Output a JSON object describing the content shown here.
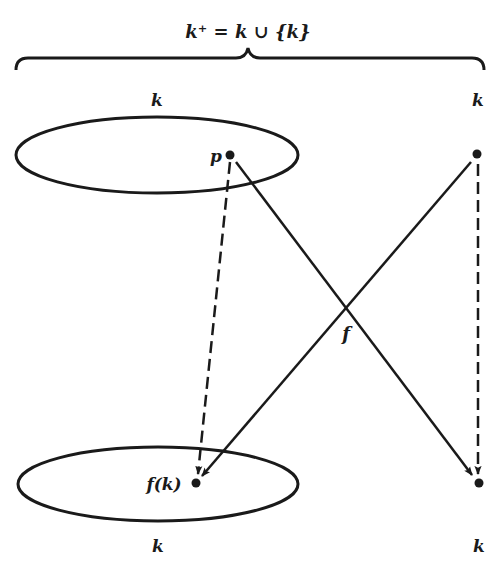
{
  "diagram": {
    "title": "k⁺ = k ∪ {k}",
    "brace_label": "k⁺ = k ∪ {k}",
    "top_left_set_label": "k",
    "top_right_label": "k",
    "bottom_left_set_label": "k",
    "bottom_right_label": "k",
    "point_p_label": "p",
    "point_fk_label": "f(k)",
    "function_label": "f",
    "colors": {
      "ink": "#1a1a1a",
      "background": "#ffffff"
    },
    "nodes": [
      {
        "id": "p",
        "label": "p",
        "x": 230,
        "y": 155
      },
      {
        "id": "k_top",
        "label": "",
        "x": 477,
        "y": 154
      },
      {
        "id": "fk",
        "label": "f(k)",
        "x": 196,
        "y": 483
      },
      {
        "id": "k_bottom",
        "label": "",
        "x": 479,
        "y": 483
      }
    ],
    "edges": [
      {
        "from": "p",
        "to": "fk",
        "style": "dashed"
      },
      {
        "from": "p",
        "to": "k_bottom",
        "style": "solid"
      },
      {
        "from": "k_top",
        "to": "fk",
        "style": "solid"
      },
      {
        "from": "k_top",
        "to": "k_bottom",
        "style": "dashed"
      }
    ]
  }
}
